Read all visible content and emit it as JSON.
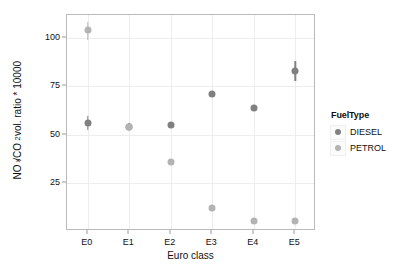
{
  "chart_data": {
    "type": "scatter",
    "title": "",
    "xlabel": "Euro class",
    "ylabel": "NOx/CO2 vol. ratio * 10000",
    "ylabel_parts": {
      "prefix": "NO",
      "sub1": "x",
      "mid": "/CO",
      "sub2": "2",
      "suffix": " vol. ratio * 10000"
    },
    "categories": [
      "E0",
      "E1",
      "E2",
      "E3",
      "E4",
      "E5"
    ],
    "x_tick_labels": [
      "E0",
      "E1",
      "E2",
      "E3",
      "E4",
      "E5"
    ],
    "y_tick_labels": [
      "25",
      "50",
      "75",
      "100"
    ],
    "y_ticks": [
      25,
      50,
      75,
      100
    ],
    "ylim": [
      0,
      112
    ],
    "grid": "horizontal-and-vertical-faint",
    "legend_position": "right",
    "series": [
      {
        "name": "DIESEL",
        "color": "#808080",
        "values": [
          56,
          54,
          55,
          71,
          64,
          83
        ],
        "err_low": [
          52.5,
          52.5,
          53.5,
          null,
          null,
          78
        ],
        "err_high": [
          59.5,
          56,
          56.5,
          null,
          null,
          88
        ]
      },
      {
        "name": "PETROL",
        "color": "#b3b3b3",
        "values": [
          104,
          54,
          36,
          12,
          5,
          5
        ],
        "err_low": [
          99,
          52.5,
          null,
          null,
          null,
          null
        ],
        "err_high": [
          108.5,
          56,
          null,
          null,
          null,
          null
        ]
      }
    ]
  },
  "legend": {
    "title": "FuelType",
    "items": [
      {
        "label": "DIESEL",
        "color": "#808080"
      },
      {
        "label": "PETROL",
        "color": "#b3b3b3"
      }
    ]
  },
  "axes": {
    "x_title": "Euro class",
    "y_tick_0": "25",
    "y_tick_1": "50",
    "y_tick_2": "75",
    "y_tick_3": "100"
  }
}
